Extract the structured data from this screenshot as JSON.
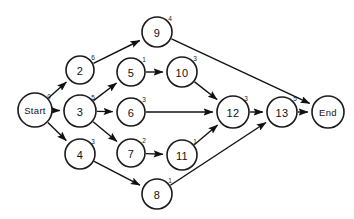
{
  "diagram": {
    "type": "directed-graph",
    "colors": {
      "background": "#ffffff",
      "node_fill": "#ffffff",
      "node_stroke": "#1a1a1a",
      "edge": "#111111",
      "text": "#111111"
    },
    "nodes": [
      {
        "id": "start",
        "label": "Start",
        "weight": "0",
        "cx": 35,
        "cy": 110,
        "r": 17,
        "terminal": true,
        "weight_dx": 14,
        "weight_dy": -14
      },
      {
        "id": "n2",
        "label": "2",
        "weight": "6",
        "cx": 80,
        "cy": 70,
        "r": 14,
        "terminal": false,
        "weight_dx": 13,
        "weight_dy": -13
      },
      {
        "id": "n3",
        "label": "3",
        "weight": "5",
        "cx": 80,
        "cy": 111,
        "r": 16,
        "terminal": false,
        "weight_dx": 13,
        "weight_dy": -14
      },
      {
        "id": "n4",
        "label": "4",
        "weight": "3",
        "cx": 80,
        "cy": 154,
        "r": 15,
        "terminal": false,
        "weight_dx": 13,
        "weight_dy": -13
      },
      {
        "id": "n5",
        "label": "5",
        "weight": "1",
        "cx": 131,
        "cy": 72,
        "r": 14,
        "terminal": false,
        "weight_dx": 13,
        "weight_dy": -13
      },
      {
        "id": "n6",
        "label": "6",
        "weight": "3",
        "cx": 131,
        "cy": 112,
        "r": 14,
        "terminal": false,
        "weight_dx": 13,
        "weight_dy": -13
      },
      {
        "id": "n7",
        "label": "7",
        "weight": "2",
        "cx": 131,
        "cy": 153,
        "r": 14,
        "terminal": false,
        "weight_dx": 13,
        "weight_dy": -13
      },
      {
        "id": "n8",
        "label": "8",
        "weight": "1",
        "cx": 157,
        "cy": 194,
        "r": 15,
        "terminal": false,
        "weight_dx": 13,
        "weight_dy": -14
      },
      {
        "id": "n9",
        "label": "9",
        "weight": "4",
        "cx": 157,
        "cy": 32,
        "r": 15,
        "terminal": false,
        "weight_dx": 13,
        "weight_dy": -14
      },
      {
        "id": "n10",
        "label": "10",
        "weight": "3",
        "cx": 182,
        "cy": 72,
        "r": 15,
        "terminal": false,
        "weight_dx": 13,
        "weight_dy": -14
      },
      {
        "id": "n11",
        "label": "11",
        "weight": "1",
        "cx": 182,
        "cy": 155,
        "r": 15,
        "terminal": false,
        "weight_dx": 13,
        "weight_dy": -14
      },
      {
        "id": "n12",
        "label": "12",
        "weight": "3",
        "cx": 233,
        "cy": 112,
        "r": 16,
        "terminal": false,
        "weight_dx": 13,
        "weight_dy": -14
      },
      {
        "id": "n13",
        "label": "13",
        "weight": "5",
        "cx": 282,
        "cy": 112,
        "r": 15,
        "terminal": false,
        "weight_dx": 13,
        "weight_dy": -14
      },
      {
        "id": "end",
        "label": "End",
        "weight": "",
        "cx": 328,
        "cy": 112,
        "r": 16,
        "terminal": true,
        "weight_dx": 0,
        "weight_dy": 0
      }
    ],
    "edges": [
      {
        "id": "e-start-2",
        "from": "start",
        "to": "n2"
      },
      {
        "id": "e-start-3",
        "from": "start",
        "to": "n3"
      },
      {
        "id": "e-start-4",
        "from": "start",
        "to": "n4"
      },
      {
        "id": "e-2-9",
        "from": "n2",
        "to": "n9"
      },
      {
        "id": "e-3-5",
        "from": "n3",
        "to": "n5"
      },
      {
        "id": "e-3-6",
        "from": "n3",
        "to": "n6"
      },
      {
        "id": "e-3-7",
        "from": "n3",
        "to": "n7"
      },
      {
        "id": "e-4-8",
        "from": "n4",
        "to": "n8"
      },
      {
        "id": "e-5-10",
        "from": "n5",
        "to": "n10"
      },
      {
        "id": "e-6-12",
        "from": "n6",
        "to": "n12"
      },
      {
        "id": "e-7-11",
        "from": "n7",
        "to": "n11"
      },
      {
        "id": "e-8-13",
        "from": "n8",
        "to": "n13"
      },
      {
        "id": "e-9-end",
        "from": "n9",
        "to": "end"
      },
      {
        "id": "e-10-12",
        "from": "n10",
        "to": "n12"
      },
      {
        "id": "e-11-12",
        "from": "n11",
        "to": "n12"
      },
      {
        "id": "e-12-13",
        "from": "n12",
        "to": "n13"
      },
      {
        "id": "e-13-end",
        "from": "n13",
        "to": "end"
      }
    ]
  }
}
